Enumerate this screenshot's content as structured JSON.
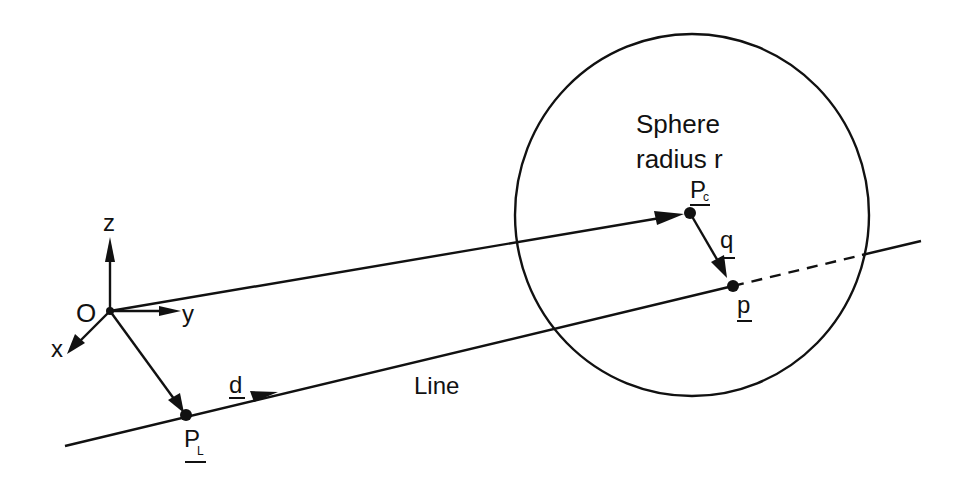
{
  "diagram": {
    "colors": {
      "ink": "#111111",
      "background": "#ffffff"
    },
    "sphere": {
      "label_line1": "Sphere",
      "label_line2": "radius r",
      "center_point": {
        "name": "P",
        "subscript": "c"
      }
    },
    "axes": {
      "origin": "O",
      "x": "x",
      "y": "y",
      "z": "z"
    },
    "line": {
      "label": "Line",
      "start_point": {
        "name": "P",
        "subscript": "L"
      },
      "direction": "d"
    },
    "vectors": {
      "q": "q",
      "p": "p"
    }
  }
}
